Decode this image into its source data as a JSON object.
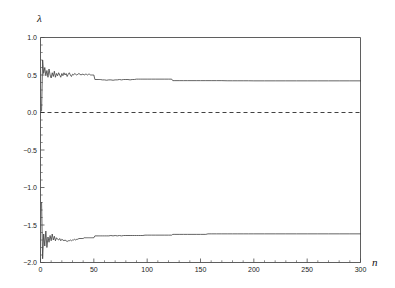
{
  "figure": {
    "background_color": "#ffffff",
    "axis_color": "#4d4d4d",
    "curve_color": "#3c3c3c",
    "zero_line_color": "#2b2b2b"
  },
  "axes": {
    "y_axis_title": "λ",
    "x_axis_title": "n",
    "x_tick_labels": [
      "0",
      "50",
      "100",
      "150",
      "200",
      "250",
      "300"
    ],
    "y_tick_labels": [
      "1.0",
      "0.5",
      "0.0",
      "−0.5",
      "−1.0",
      "−1.5",
      "−2.0"
    ]
  },
  "chart_data": {
    "type": "line",
    "title": "",
    "subtitle": "",
    "xlabel": "n",
    "ylabel": "λ",
    "xlim": [
      0,
      300
    ],
    "ylim": [
      -2.0,
      1.0
    ],
    "xticks": [
      0,
      50,
      100,
      150,
      200,
      250,
      300
    ],
    "yticks": [
      1.0,
      0.5,
      0.0,
      -0.5,
      -1.0,
      -1.5,
      -2.0
    ],
    "minor_ticks": true,
    "grid": false,
    "legend": null,
    "annotations": [
      {
        "text": "zero reference line",
        "type": "hline",
        "y": 0.0,
        "style": "dashed"
      }
    ],
    "series": [
      {
        "name": "lambda_1",
        "converges_to": 0.42,
        "x": [
          1,
          2,
          3,
          4,
          5,
          6,
          7,
          8,
          9,
          10,
          11,
          12,
          13,
          14,
          15,
          16,
          17,
          18,
          19,
          20,
          21,
          22,
          23,
          24,
          25,
          26,
          27,
          28,
          29,
          30,
          31,
          32,
          33,
          34,
          35,
          36,
          37,
          38,
          39,
          40,
          41,
          42,
          43,
          44,
          45,
          46,
          47,
          48,
          49,
          50,
          51,
          52,
          53,
          54,
          55,
          56,
          58,
          60,
          62,
          64,
          66,
          68,
          70,
          72,
          74,
          76,
          78,
          80,
          82,
          84,
          86,
          88,
          90,
          92,
          94,
          96,
          98,
          100,
          104,
          108,
          112,
          116,
          120,
          123,
          124,
          126,
          130,
          134,
          138,
          142,
          146,
          150,
          155,
          160,
          165,
          170,
          175,
          180,
          185,
          190,
          195,
          200,
          210,
          220,
          230,
          240,
          250,
          260,
          270,
          280,
          290,
          300
        ],
        "y": [
          0.02,
          0.7,
          0.52,
          0.6,
          0.49,
          0.56,
          0.47,
          0.58,
          0.5,
          0.46,
          0.53,
          0.48,
          0.55,
          0.47,
          0.52,
          0.49,
          0.53,
          0.5,
          0.47,
          0.52,
          0.49,
          0.53,
          0.5,
          0.52,
          0.48,
          0.51,
          0.53,
          0.5,
          0.48,
          0.51,
          0.5,
          0.52,
          0.51,
          0.5,
          0.51,
          0.52,
          0.51,
          0.5,
          0.51,
          0.51,
          0.5,
          0.51,
          0.51,
          0.5,
          0.51,
          0.51,
          0.5,
          0.5,
          0.5,
          0.5,
          0.44,
          0.44,
          0.44,
          0.44,
          0.44,
          0.44,
          0.435,
          0.435,
          0.43,
          0.435,
          0.435,
          0.43,
          0.435,
          0.435,
          0.44,
          0.435,
          0.44,
          0.44,
          0.44,
          0.435,
          0.44,
          0.44,
          0.445,
          0.445,
          0.445,
          0.445,
          0.445,
          0.445,
          0.445,
          0.445,
          0.445,
          0.445,
          0.445,
          0.445,
          0.425,
          0.425,
          0.425,
          0.425,
          0.425,
          0.425,
          0.425,
          0.425,
          0.425,
          0.425,
          0.425,
          0.425,
          0.423,
          0.423,
          0.423,
          0.423,
          0.423,
          0.422,
          0.422,
          0.422,
          0.422,
          0.422,
          0.422,
          0.422,
          0.422,
          0.422,
          0.422,
          0.422
        ]
      },
      {
        "name": "lambda_2",
        "converges_to": -1.62,
        "x": [
          1,
          2,
          3,
          4,
          5,
          6,
          7,
          8,
          9,
          10,
          11,
          12,
          13,
          14,
          15,
          16,
          17,
          18,
          19,
          20,
          21,
          22,
          23,
          24,
          25,
          26,
          27,
          28,
          29,
          30,
          31,
          32,
          33,
          34,
          35,
          36,
          37,
          38,
          39,
          40,
          41,
          42,
          43,
          44,
          45,
          46,
          47,
          48,
          49,
          50,
          51,
          52,
          53,
          54,
          55,
          56,
          58,
          60,
          62,
          64,
          66,
          68,
          70,
          72,
          74,
          76,
          78,
          80,
          82,
          84,
          86,
          88,
          90,
          92,
          94,
          96,
          98,
          100,
          104,
          108,
          112,
          116,
          120,
          123,
          124,
          126,
          130,
          134,
          138,
          142,
          146,
          150,
          155,
          157,
          160,
          165,
          170,
          175,
          180,
          185,
          190,
          195,
          200,
          210,
          220,
          230,
          240,
          250,
          260,
          270,
          280,
          290,
          300
        ],
        "y": [
          -1.2,
          -1.95,
          -1.62,
          -1.78,
          -1.58,
          -1.8,
          -1.66,
          -1.73,
          -1.64,
          -1.71,
          -1.62,
          -1.7,
          -1.65,
          -1.71,
          -1.67,
          -1.69,
          -1.7,
          -1.68,
          -1.71,
          -1.69,
          -1.7,
          -1.71,
          -1.7,
          -1.71,
          -1.72,
          -1.71,
          -1.71,
          -1.7,
          -1.71,
          -1.7,
          -1.7,
          -1.69,
          -1.7,
          -1.69,
          -1.69,
          -1.68,
          -1.68,
          -1.68,
          -1.68,
          -1.68,
          -1.67,
          -1.67,
          -1.67,
          -1.67,
          -1.67,
          -1.67,
          -1.67,
          -1.67,
          -1.67,
          -1.67,
          -1.645,
          -1.645,
          -1.645,
          -1.645,
          -1.645,
          -1.645,
          -1.645,
          -1.645,
          -1.645,
          -1.645,
          -1.64,
          -1.645,
          -1.64,
          -1.645,
          -1.64,
          -1.645,
          -1.64,
          -1.64,
          -1.64,
          -1.64,
          -1.64,
          -1.64,
          -1.64,
          -1.64,
          -1.64,
          -1.64,
          -1.635,
          -1.635,
          -1.635,
          -1.635,
          -1.635,
          -1.635,
          -1.635,
          -1.635,
          -1.625,
          -1.625,
          -1.625,
          -1.625,
          -1.625,
          -1.625,
          -1.625,
          -1.625,
          -1.625,
          -1.618,
          -1.618,
          -1.618,
          -1.618,
          -1.618,
          -1.618,
          -1.618,
          -1.618,
          -1.618,
          -1.618,
          -1.618,
          -1.618,
          -1.618,
          -1.618,
          -1.618,
          -1.618,
          -1.618,
          -1.618,
          -1.618,
          -1.618
        ]
      }
    ]
  }
}
